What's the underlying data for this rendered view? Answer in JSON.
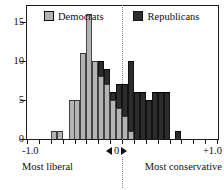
{
  "chart_data": {
    "type": "bar",
    "title": "",
    "subtitle": "",
    "xlabel": "",
    "ylabel": "",
    "xlim": [
      -1.0,
      1.0
    ],
    "ylim": [
      0,
      17
    ],
    "grid": false,
    "legend_position": "top-center",
    "bin_width": 0.0625,
    "stacked": true,
    "annotations": {
      "left_end": "Most liberal",
      "right_end": "Most conservative",
      "zero_marker": "0",
      "zero_arrow_left": "left-triangle",
      "zero_arrow_right": "right-triangle"
    },
    "x_tick_labels": [
      "-1.0",
      "+1.0"
    ],
    "x_tick_values": [
      -1.0,
      1.0
    ],
    "y_tick_labels": [
      "0",
      "5",
      "10",
      "15"
    ],
    "y_tick_values": [
      0,
      5,
      10,
      15
    ],
    "legend": [
      {
        "name": "Democrats",
        "color": "#b4b4b4"
      },
      {
        "name": "Republicans",
        "color": "#2c2c2c"
      }
    ],
    "bin_centers": [
      -0.719,
      -0.656,
      -0.594,
      -0.531,
      -0.469,
      -0.406,
      -0.344,
      -0.281,
      -0.219,
      -0.156,
      -0.094,
      -0.031,
      0.031,
      0.094,
      0.156,
      0.219,
      0.281,
      0.344,
      0.406,
      0.469,
      0.531,
      0.594,
      0.656,
      0.719
    ],
    "series": [
      {
        "name": "Democrats",
        "color": "#b4b4b4",
        "values": [
          1,
          1,
          0,
          5,
          5,
          11,
          16,
          10,
          8,
          7,
          5,
          4,
          3,
          1,
          0,
          0,
          0,
          0,
          0,
          0,
          0,
          0,
          0,
          0
        ]
      },
      {
        "name": "Republicans",
        "color": "#2c2c2c",
        "values": [
          0,
          0,
          0,
          0,
          0,
          0,
          0,
          0,
          2,
          2,
          1,
          3,
          4,
          9,
          6,
          6,
          5,
          6,
          6,
          6,
          0,
          1,
          0,
          0
        ]
      }
    ],
    "totals": [
      1,
      1,
      0,
      5,
      5,
      11,
      16,
      10,
      10,
      9,
      6,
      7,
      7,
      10,
      6,
      6,
      5,
      6,
      6,
      6,
      0,
      1,
      0,
      0
    ]
  },
  "legend": {
    "democrats_label": "Democrats",
    "republicans_label": "Republicans"
  },
  "axis": {
    "y_ticks": [
      "15",
      "10",
      "5",
      "0"
    ],
    "x_left_value": "-1.0",
    "x_right_value": "+1.0",
    "x_zero_value": "0",
    "left_caption": "Most liberal",
    "right_caption": "Most conservative"
  }
}
